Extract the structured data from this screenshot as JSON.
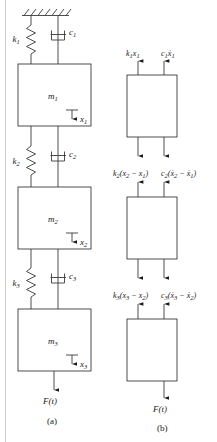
{
  "figure": {
    "captions": {
      "a": "(a)",
      "b": "(b)"
    }
  },
  "system": {
    "ground": "fixed-support-hatching",
    "springs": [
      {
        "name": "k1",
        "label": "k",
        "sub": "1"
      },
      {
        "name": "k2",
        "label": "k",
        "sub": "2"
      },
      {
        "name": "k3",
        "label": "k",
        "sub": "3"
      }
    ],
    "dampers": [
      {
        "name": "c1",
        "label": "c",
        "sub": "1"
      },
      {
        "name": "c2",
        "label": "c",
        "sub": "2"
      },
      {
        "name": "c3",
        "label": "c",
        "sub": "3"
      }
    ],
    "masses": [
      {
        "name": "m1",
        "label": "m",
        "sub": "1"
      },
      {
        "name": "m2",
        "label": "m",
        "sub": "2"
      },
      {
        "name": "m3",
        "label": "m",
        "sub": "3"
      }
    ],
    "displacements": [
      {
        "name": "x1",
        "label": "x",
        "sub": "1"
      },
      {
        "name": "x2",
        "label": "x",
        "sub": "2"
      },
      {
        "name": "x3",
        "label": "x",
        "sub": "3"
      }
    ],
    "force": {
      "label": "F",
      "arg": "(t)"
    }
  },
  "fbd": {
    "blocks": [
      {
        "mass": "m1",
        "spring_force": "k₁x₁",
        "damper_force": "c₁ẋ₁",
        "spring_force_parts": {
          "base": "k",
          "sub": "1",
          "var": "x",
          "varsub": "1"
        },
        "damper_force_parts": {
          "base": "c",
          "sub": "1",
          "var": "ẋ",
          "varsub": "1"
        }
      },
      {
        "mass": "m2",
        "spring_force": "k₂(x₂ − x₁)",
        "damper_force": "c₂(ẋ₂ − ẋ₁)"
      },
      {
        "mass": "m3",
        "spring_force": "k₃(x₃ − x₂)",
        "damper_force": "c₃(ẋ₃ − ẋ₂)"
      }
    ],
    "force": {
      "label": "F",
      "arg": "(t)"
    }
  },
  "colors": {
    "line": "#3a3a3a",
    "text": "#1a1a1a",
    "background": "#ffffff",
    "page_edge": "#c8c8c8"
  }
}
